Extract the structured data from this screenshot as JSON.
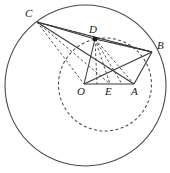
{
  "figure": {
    "width": 170,
    "height": 173,
    "background": "#ffffff",
    "stroke_color": "#3a3a3a",
    "label_color": "#1a1a1a"
  },
  "circles": [
    {
      "name": "outer-circle",
      "style": "solid",
      "cx": 85.5,
      "cy": 85.5,
      "r": 80.5,
      "stroke": "#4a4a4a",
      "stroke_width": 1.1
    },
    {
      "name": "inner-dashed-circle",
      "style": "dashed",
      "cx": 105,
      "cy": 84.5,
      "r": 46.5,
      "stroke": "#4a4a4a",
      "stroke_width": 1.1,
      "dash": "3 2.4"
    }
  ],
  "points": [
    {
      "id": "C",
      "label": "C",
      "x": 37,
      "y": 22,
      "label_x": 25,
      "label_y": 8,
      "marker": false
    },
    {
      "id": "D",
      "label": "D",
      "x": 95,
      "y": 39,
      "label_x": 89,
      "label_y": 24,
      "marker": true
    },
    {
      "id": "B",
      "label": "B",
      "x": 152,
      "y": 52,
      "label_x": 157,
      "label_y": 40,
      "marker": false
    },
    {
      "id": "O",
      "label": "O",
      "x": 84,
      "y": 84,
      "label_x": 77,
      "label_y": 86,
      "marker": false
    },
    {
      "id": "E",
      "label": "E",
      "x": 110,
      "y": 84,
      "label_x": 105,
      "label_y": 86,
      "marker": false
    },
    {
      "id": "A",
      "label": "A",
      "x": 134,
      "y": 84,
      "label_x": 131,
      "label_y": 86,
      "marker": false
    }
  ],
  "segments_solid": [
    {
      "name": "segment-C-D",
      "from": "C",
      "to": "D"
    },
    {
      "name": "segment-D-B",
      "from": "D",
      "to": "B"
    },
    {
      "name": "segment-C-B",
      "from": "C",
      "to": "B"
    },
    {
      "name": "segment-C-A",
      "from": "C",
      "to": "A"
    },
    {
      "name": "segment-O-A",
      "from": "O",
      "to": "A"
    },
    {
      "name": "segment-O-B",
      "from": "O",
      "to": "B"
    },
    {
      "name": "segment-A-B",
      "from": "A",
      "to": "B"
    },
    {
      "name": "segment-D-O",
      "from": "D",
      "to": "O"
    }
  ],
  "segments_dashed": [
    {
      "name": "segment-C-O-dashed",
      "from": "C",
      "to": "O"
    },
    {
      "name": "segment-C-E-dashed",
      "from": "C",
      "to": "E"
    },
    {
      "name": "segment-D-E-dashed",
      "from": "D",
      "to": "E"
    },
    {
      "name": "segment-D-A-dashed",
      "from": "D",
      "to": "A"
    },
    {
      "name": "segment-D-mid1-dashed",
      "from": "D",
      "to": "M1"
    },
    {
      "name": "segment-D-mid2-dashed",
      "from": "D",
      "to": "M2"
    },
    {
      "name": "segment-D-B-dashed",
      "from": "D",
      "to": "B"
    },
    {
      "name": "segment-C-B-dashed-lower",
      "from": "C",
      "to": "B"
    }
  ],
  "helper_points": [
    {
      "id": "M1",
      "x": 97,
      "y": 84
    },
    {
      "id": "M2",
      "x": 122,
      "y": 84
    }
  ]
}
